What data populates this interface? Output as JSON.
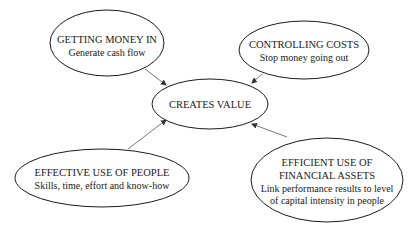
{
  "diagram": {
    "center": {
      "title": "CREATES VALUE"
    },
    "nodes": [
      {
        "id": "getting-money-in",
        "title_lines": [
          "GETTING MONEY IN"
        ],
        "sub_lines": [
          "Generate cash flow"
        ]
      },
      {
        "id": "controlling-costs",
        "title_lines": [
          "CONTROLLING COSTS"
        ],
        "sub_lines": [
          "Stop money going out"
        ]
      },
      {
        "id": "effective-use-of-people",
        "title_lines": [
          "EFFECTIVE USE OF PEOPLE"
        ],
        "sub_lines": [
          "Skills, time, effort and know-how"
        ]
      },
      {
        "id": "efficient-use-of-financial-assets",
        "title_lines": [
          "EFFICIENT USE OF",
          "FINANCIAL ASSETS"
        ],
        "sub_lines": [
          "Link performance results to level",
          "of capital intensity in people"
        ]
      }
    ],
    "edges": [
      {
        "from": "getting-money-in",
        "to": "center"
      },
      {
        "from": "controlling-costs",
        "to": "center"
      },
      {
        "from": "effective-use-of-people",
        "to": "center"
      },
      {
        "from": "efficient-use-of-financial-assets",
        "to": "center"
      }
    ],
    "colors": {
      "stroke": "#1a1a1a",
      "fill": "#ffffff",
      "arrow": "#444444"
    }
  }
}
